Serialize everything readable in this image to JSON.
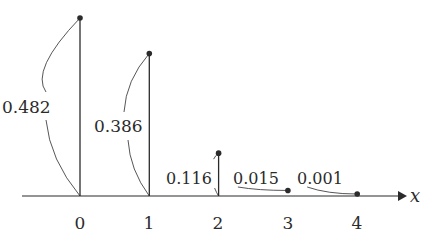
{
  "chart_data": {
    "type": "bar",
    "subtype": "stem",
    "title": "",
    "xlabel": "x",
    "ylabel": "",
    "categories": [
      "0",
      "1",
      "2",
      "3",
      "4"
    ],
    "x": [
      0,
      1,
      2,
      3,
      4
    ],
    "values": [
      0.482,
      0.386,
      0.116,
      0.015,
      0.001
    ],
    "value_labels": [
      "0.482",
      "0.386",
      "0.116",
      "0.015",
      "0.001"
    ],
    "ylim": [
      0,
      0.5
    ],
    "grid": false,
    "legend": null,
    "annotations": "Each stem's probability value is labeled with a curved brace-like arc connecting the label to its stem"
  },
  "colors": {
    "stroke": "#2b2b2b",
    "background": "#ffffff"
  }
}
